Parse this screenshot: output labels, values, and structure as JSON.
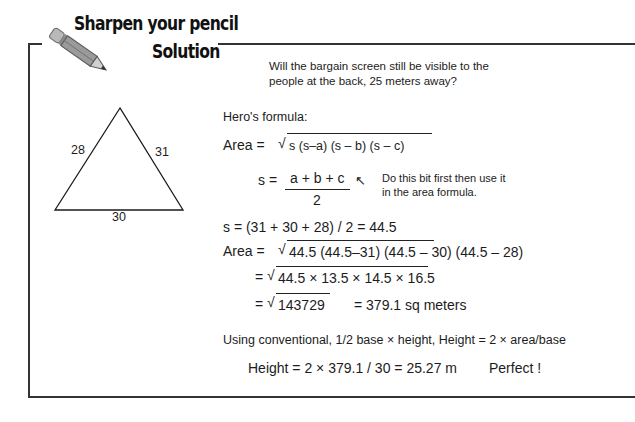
{
  "header": {
    "title_line1": "Sharpen your pencil",
    "title_line2": "Solution",
    "icon": "pencil-icon"
  },
  "question": {
    "line1": "Will the bargain screen still be visible to the",
    "line2": "people at the back, 25 meters away?"
  },
  "triangle": {
    "side_left": "28",
    "side_right": "31",
    "side_bottom": "30"
  },
  "solution": {
    "heros_label": "Hero's formula:",
    "area_formula_prefix": "Area =",
    "area_formula_radicand": "s (s–a) (s – b) (s – c)",
    "s_prefix": "s =",
    "s_numerator": "a + b + c",
    "s_denominator": "2",
    "note_arrow": "↖",
    "note_line1": "Do this bit first then use it",
    "note_line2": "in the  area formula.",
    "s_calc": "s = (31 + 30 + 28) / 2 = 44.5",
    "area_sub_prefix": "Area =",
    "area_sub_radicand": "44.5 (44.5–31) (44.5 – 30) (44.5 – 28)",
    "area_step2_prefix": "=",
    "area_step2_radicand": "44.5 × 13.5 × 14.5 × 16.5",
    "area_step3_prefix": "=",
    "area_step3_radicand": "143729",
    "area_result": "=   379.1 sq meters",
    "conventional": "Using conventional, 1/2 base × height, Height = 2 × area/base",
    "height_calc": "Height = 2 × 379.1 / 30 = 25.27 m",
    "verdict": "Perfect !"
  }
}
